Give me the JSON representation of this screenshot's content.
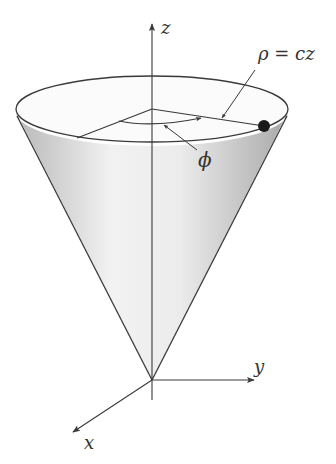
{
  "diagram": {
    "axes": {
      "z_label": "z",
      "y_label": "y",
      "x_label": "x"
    },
    "annotations": {
      "surface_equation": "ρ = cz",
      "angle_label": "ϕ"
    },
    "colors": {
      "line": "#3a3a3a",
      "cone_fill_light": "#f4f4f4",
      "cone_fill_dark": "#bdbdbd",
      "point": "#1a1a1a"
    }
  }
}
